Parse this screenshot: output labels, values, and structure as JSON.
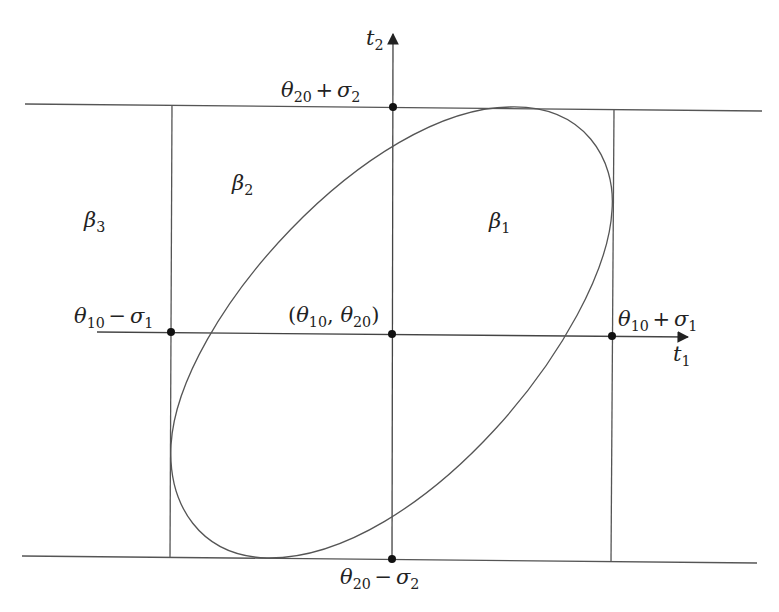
{
  "diagram": {
    "title": "",
    "axes": {
      "x_axis": {
        "symbol": "t",
        "subscript": "1"
      },
      "y_axis": {
        "symbol": "t",
        "subscript": "2"
      }
    },
    "points": {
      "center": {
        "open": "(",
        "a": "θ",
        "a_sub": "10",
        "sep": ", ",
        "b": "θ",
        "b_sub": "20",
        "close": ")"
      },
      "left": {
        "a": "θ",
        "a_sub": "10",
        "op": "−",
        "b": "σ",
        "b_sub": "1"
      },
      "right": {
        "a": "θ",
        "a_sub": "10",
        "op": "+",
        "b": "σ",
        "b_sub": "1"
      },
      "top": {
        "a": "θ",
        "a_sub": "20",
        "op": "+",
        "b": "σ",
        "b_sub": "2"
      },
      "bottom": {
        "a": "θ",
        "a_sub": "20",
        "op": "−",
        "b": "σ",
        "b_sub": "2"
      }
    },
    "regions": [
      {
        "symbol": "β",
        "subscript": "1"
      },
      {
        "symbol": "β",
        "subscript": "2"
      },
      {
        "symbol": "β",
        "subscript": "3"
      }
    ],
    "colors": {
      "line": "#555555",
      "dot": "#111111",
      "text": "#222222",
      "background": "#ffffff"
    }
  }
}
